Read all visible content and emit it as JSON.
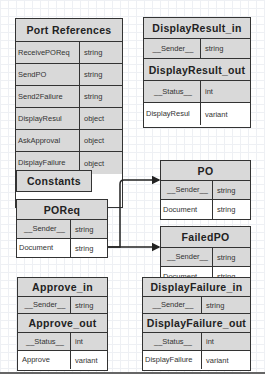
{
  "port_references": {
    "title": "Port References",
    "rows": [
      {
        "name": "ReceivePOReq",
        "type": "string"
      },
      {
        "name": "SendPO",
        "type": "string"
      },
      {
        "name": "Send2Failure",
        "type": "string"
      },
      {
        "name": "DisplayResul",
        "type": "object"
      },
      {
        "name": "AskApproval",
        "type": "object"
      },
      {
        "name": "DisplayFailure",
        "type": "object"
      }
    ]
  },
  "display_result": {
    "in_title": "DisplayResult_in",
    "in_rows": [
      {
        "name": "__Sender__",
        "type": "string"
      }
    ],
    "out_title": "DisplayResult_out",
    "out_rows": [
      {
        "name": "__Status__",
        "type": "int"
      },
      {
        "name": "DisplayResul",
        "type": "variant"
      }
    ]
  },
  "constants": {
    "title": "Constants"
  },
  "poreq": {
    "title": "POReq",
    "rows": [
      {
        "name": "__Sender__",
        "type": "string"
      },
      {
        "name": "Document",
        "type": "string"
      }
    ]
  },
  "po": {
    "title": "PO",
    "rows": [
      {
        "name": "__Sender__",
        "type": "string"
      },
      {
        "name": "Document",
        "type": "string"
      }
    ]
  },
  "failed_po": {
    "title": "FailedPO",
    "rows": [
      {
        "name": "__Sender__",
        "type": "string"
      },
      {
        "name": "Document",
        "type": "string"
      }
    ]
  },
  "approve": {
    "in_title": "Approve_in",
    "in_rows": [
      {
        "name": "__Sender__",
        "type": "string"
      }
    ],
    "out_title": "Approve_out",
    "out_rows": [
      {
        "name": "__Status__",
        "type": "int"
      },
      {
        "name": "Approve",
        "type": "variant"
      }
    ]
  },
  "display_failure": {
    "in_title": "DisplayFailure_in",
    "in_rows": [
      {
        "name": "__Sender__",
        "type": "string"
      }
    ],
    "out_title": "DisplayFailure_out",
    "out_rows": [
      {
        "name": "__Status__",
        "type": "int"
      },
      {
        "name": "DisplayFailure",
        "type": "variant"
      }
    ]
  },
  "links": [
    {
      "from": "POReq.Document",
      "to": "PO.Document"
    },
    {
      "from": "POReq.Document",
      "to": "FailedPO.Document"
    }
  ]
}
